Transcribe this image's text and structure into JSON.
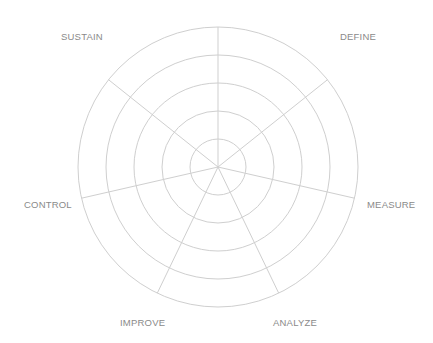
{
  "chart_data": {
    "type": "radar",
    "title": "",
    "axes": [
      "",
      "DEFINE",
      "MEASURE",
      "ANALYZE",
      "IMPROVE",
      "CONTROL",
      "SUSTAIN"
    ],
    "rings": 5,
    "series": [],
    "grid": true,
    "legend": "none"
  },
  "labels": {
    "top": "",
    "define": "DEFINE",
    "measure": "MEASURE",
    "analyze": "ANALYZE",
    "improve": "IMPROVE",
    "control": "CONTROL",
    "sustain": "SUSTAIN"
  },
  "style": {
    "grid_color": "#cfcfcf",
    "label_color": "#8a8a8a"
  }
}
